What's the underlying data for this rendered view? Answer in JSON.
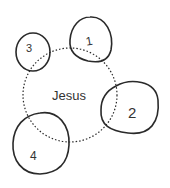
{
  "diagram": {
    "center": {
      "label": "Jesus",
      "style": "dotted"
    },
    "nodes": [
      {
        "label": "1"
      },
      {
        "label": "2"
      },
      {
        "label": "3"
      },
      {
        "label": "4"
      }
    ]
  },
  "colors": {
    "stroke": "#2a2a2a",
    "text": "#333333",
    "background": "#ffffff"
  }
}
